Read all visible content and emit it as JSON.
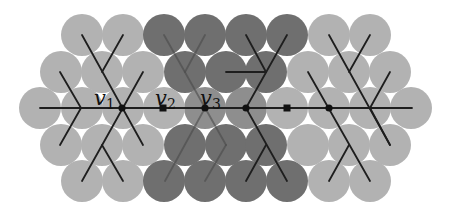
{
  "diagram": {
    "type": "hexagonal-circle-packing-with-trees",
    "colors": {
      "background": "#ffffff",
      "light_circle": "#b2b2b2",
      "dark_circle": "#6f6f6f",
      "medium_circle": "#8e8e8e",
      "edge": "#1e1e1e",
      "faint_edge": "#4a4a4a",
      "node": "#111111"
    },
    "circle_radius": 21,
    "groups": [
      {
        "name": "left-cluster",
        "shade": "light",
        "circles": [
          [
            82,
            35
          ],
          [
            123,
            35
          ],
          [
            61,
            72
          ],
          [
            102,
            72
          ],
          [
            143,
            72
          ],
          [
            40,
            108
          ],
          [
            82,
            108
          ],
          [
            123,
            108
          ],
          [
            102,
            145
          ],
          [
            143,
            145
          ],
          [
            61,
            145
          ],
          [
            82,
            181
          ],
          [
            123,
            181
          ]
        ]
      },
      {
        "name": "middle-cluster",
        "shade": "dark",
        "circles": [
          [
            164,
            35
          ],
          [
            205,
            35
          ],
          [
            246,
            35
          ],
          [
            287,
            35
          ],
          [
            185,
            72
          ],
          [
            226,
            72
          ],
          [
            266,
            72
          ],
          [
            185,
            145
          ],
          [
            226,
            145
          ],
          [
            266,
            145
          ],
          [
            164,
            181
          ],
          [
            205,
            181
          ],
          [
            246,
            181
          ],
          [
            287,
            181
          ]
        ]
      },
      {
        "name": "middle-cluster-center-row",
        "shade": "medium",
        "circles": [
          [
            205,
            108
          ],
          [
            246,
            108
          ]
        ]
      },
      {
        "name": "middle-light-center",
        "shade": "light",
        "circles": [
          [
            164,
            108
          ]
        ]
      },
      {
        "name": "right-cluster",
        "shade": "light",
        "circles": [
          [
            329,
            35
          ],
          [
            370,
            35
          ],
          [
            308,
            72
          ],
          [
            349,
            72
          ],
          [
            390,
            72
          ],
          [
            287,
            108
          ],
          [
            329,
            108
          ],
          [
            370,
            108
          ],
          [
            411,
            108
          ],
          [
            308,
            145
          ],
          [
            349,
            145
          ],
          [
            390,
            145
          ],
          [
            329,
            181
          ],
          [
            370,
            181
          ]
        ]
      }
    ],
    "edges": [
      {
        "from": [
          40,
          108
        ],
        "to": [
          412,
          108
        ],
        "style": "solid"
      },
      {
        "from": [
          81,
          108
        ],
        "to": [
          60,
          72
        ],
        "style": "solid"
      },
      {
        "from": [
          81,
          108
        ],
        "to": [
          60,
          145
        ],
        "style": "solid"
      },
      {
        "from": [
          82,
          35
        ],
        "to": [
          143,
          145
        ],
        "style": "solid"
      },
      {
        "from": [
          123,
          35
        ],
        "to": [
          102,
          72
        ],
        "style": "solid"
      },
      {
        "from": [
          143,
          72
        ],
        "to": [
          82,
          181
        ],
        "style": "solid"
      },
      {
        "from": [
          102,
          145
        ],
        "to": [
          123,
          181
        ],
        "style": "solid"
      },
      {
        "from": [
          164,
          35
        ],
        "to": [
          226,
          145
        ],
        "style": "faint"
      },
      {
        "from": [
          205,
          35
        ],
        "to": [
          185,
          72
        ],
        "style": "faint"
      },
      {
        "from": [
          205,
          108
        ],
        "to": [
          165,
          181
        ],
        "style": "faint"
      },
      {
        "from": [
          226,
          145
        ],
        "to": [
          205,
          181
        ],
        "style": "faint"
      },
      {
        "from": [
          287,
          35
        ],
        "to": [
          246,
          108
        ],
        "style": "solid"
      },
      {
        "from": [
          246,
          35
        ],
        "to": [
          266,
          72
        ],
        "style": "solid"
      },
      {
        "from": [
          226,
          72
        ],
        "to": [
          266,
          72
        ],
        "style": "solid"
      },
      {
        "from": [
          246,
          108
        ],
        "to": [
          287,
          181
        ],
        "style": "solid"
      },
      {
        "from": [
          266,
          145
        ],
        "to": [
          246,
          181
        ],
        "style": "solid"
      },
      {
        "from": [
          329,
          35
        ],
        "to": [
          390,
          145
        ],
        "style": "solid"
      },
      {
        "from": [
          370,
          35
        ],
        "to": [
          349,
          72
        ],
        "style": "solid"
      },
      {
        "from": [
          349,
          72
        ],
        "to": [
          308,
          145
        ],
        "style": "none"
      },
      {
        "from": [
          308,
          72
        ],
        "to": [
          370,
          181
        ],
        "style": "solid"
      },
      {
        "from": [
          349,
          145
        ],
        "to": [
          329,
          181
        ],
        "style": "solid"
      },
      {
        "from": [
          370,
          108
        ],
        "to": [
          390,
          72
        ],
        "style": "solid"
      },
      {
        "from": [
          370,
          108
        ],
        "to": [
          390,
          145
        ],
        "style": "solid"
      }
    ],
    "nodes": [
      {
        "id": "v1",
        "x": 122,
        "y": 108,
        "shape": "circle"
      },
      {
        "id": "v2",
        "x": 163,
        "y": 108,
        "shape": "square"
      },
      {
        "id": "v3",
        "x": 205,
        "y": 108,
        "shape": "circle"
      },
      {
        "id": "n4",
        "x": 246,
        "y": 108,
        "shape": "circle"
      },
      {
        "id": "n5",
        "x": 287,
        "y": 108,
        "shape": "square"
      },
      {
        "id": "n6",
        "x": 329,
        "y": 108,
        "shape": "circle"
      }
    ],
    "labels": [
      {
        "text": "v",
        "sub": "1",
        "x": 94,
        "y": 105
      },
      {
        "text": "v",
        "sub": "2",
        "x": 155,
        "y": 105
      },
      {
        "text": "v",
        "sub": "3",
        "x": 200,
        "y": 105
      }
    ]
  }
}
